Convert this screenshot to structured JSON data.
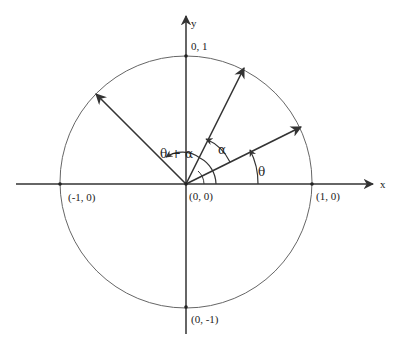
{
  "diagram": {
    "type": "unit-circle-angle-addition",
    "axes": {
      "x_label": "x",
      "y_label": "y"
    },
    "points": {
      "origin": "(0, 0)",
      "pos_x": "(1, 0)",
      "neg_x": "(-1, 0)",
      "pos_y": "0, 1",
      "neg_y": "(0, -1)"
    },
    "angles": {
      "theta": "θ",
      "alpha": "α",
      "theta_plus_alpha": "θ + α"
    },
    "colors": {
      "stroke": "#333333",
      "circle": "#666666",
      "background": "#ffffff"
    }
  }
}
